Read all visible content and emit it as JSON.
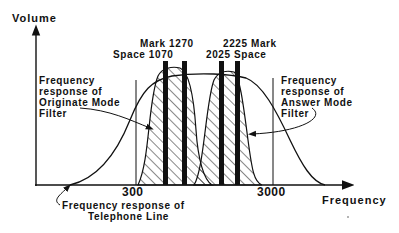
{
  "diagram": {
    "y_axis_label": "Volume",
    "x_axis_label": "Frequency",
    "ticks": {
      "low": "300",
      "high": "3000"
    },
    "tones": {
      "originate_space": "Space 1070",
      "originate_mark": "Mark 1270",
      "answer_space": "2025 Space",
      "answer_mark": "2225 Mark"
    },
    "annotations": {
      "originate_filter": [
        "Frequency",
        "response of",
        "Originate Mode",
        "Filter"
      ],
      "answer_filter": [
        "Frequency",
        "response of",
        "Answer Mode",
        "Filter"
      ],
      "telephone_line": [
        "Frequency response of",
        "Telephone Line"
      ]
    },
    "colors": {
      "ink": "#111111",
      "background": "#ffffff"
    }
  }
}
